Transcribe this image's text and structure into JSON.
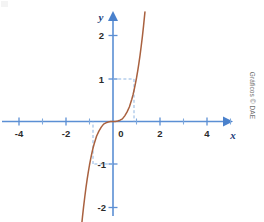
{
  "figure": {
    "credit": "Gráficos © DAE",
    "x_axis_name": "x",
    "y_axis_name": "y",
    "axis_color": "#5b8fd4",
    "curve_color": "#a9613f",
    "guide_color": "#8fb5e2",
    "background_color": "#ffffff"
  },
  "chart_data": {
    "type": "line",
    "title": "",
    "subtitle": "",
    "xlabel": "x",
    "ylabel": "y",
    "function": "y = x^3",
    "xlim": [
      -5.0,
      5.6
    ],
    "ylim": [
      -2.4,
      2.6
    ],
    "grid": false,
    "legend": null,
    "x_ticks": [
      -5,
      -4,
      -3,
      -2,
      -1,
      1,
      2,
      3,
      4,
      5
    ],
    "x_tick_labels": [
      {
        "value": -4,
        "label": "-4"
      },
      {
        "value": -2,
        "label": "-2"
      },
      {
        "value": 0,
        "label": "0"
      },
      {
        "value": 2,
        "label": "2"
      },
      {
        "value": 4,
        "label": "4"
      }
    ],
    "y_ticks": [
      -2,
      -1,
      1,
      2
    ],
    "y_tick_labels": [
      {
        "value": 2,
        "label": "2"
      },
      {
        "value": 1,
        "label": "1"
      },
      {
        "value": -1,
        "label": "-1"
      },
      {
        "value": -2,
        "label": "-2"
      }
    ],
    "series": [
      {
        "name": "y = x^3",
        "color": "#a9613f",
        "x": [
          -1.34,
          -1.3,
          -1.25,
          -1.2,
          -1.15,
          -1.1,
          -1.05,
          -1.0,
          -0.95,
          -0.9,
          -0.85,
          -0.8,
          -0.7,
          -0.6,
          -0.5,
          -0.4,
          -0.3,
          -0.2,
          -0.1,
          0.0,
          0.1,
          0.2,
          0.3,
          0.4,
          0.5,
          0.6,
          0.7,
          0.8,
          0.85,
          0.9,
          0.95,
          1.0,
          1.05,
          1.1,
          1.15,
          1.2,
          1.25,
          1.3,
          1.36
        ],
        "y": [
          -2.41,
          -2.2,
          -1.95,
          -1.73,
          -1.52,
          -1.33,
          -1.16,
          -1.0,
          -0.86,
          -0.73,
          -0.61,
          -0.51,
          -0.34,
          -0.22,
          -0.13,
          -0.06,
          -0.03,
          -0.01,
          0.0,
          0.0,
          0.0,
          0.01,
          0.03,
          0.06,
          0.13,
          0.22,
          0.34,
          0.51,
          0.61,
          0.73,
          0.86,
          1.0,
          1.16,
          1.33,
          1.52,
          1.73,
          1.95,
          2.2,
          2.52
        ]
      }
    ],
    "annotations": [
      {
        "type": "guide-lines",
        "point": [
          0.9,
          1.0
        ],
        "note": "dashed lines from axes to curve at y = 1"
      },
      {
        "type": "guide-lines",
        "point": [
          -0.85,
          -1.0
        ],
        "note": "dashed lines from axes to curve at y = -1"
      }
    ]
  }
}
